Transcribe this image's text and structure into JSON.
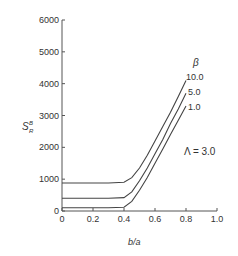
{
  "chart_data": {
    "type": "line",
    "title": "",
    "xlabel": "b/a",
    "ylabel": "S_R^B",
    "xlim": [
      0,
      1.0
    ],
    "ylim": [
      0,
      6000
    ],
    "xticks": [
      "0",
      "0.2",
      "0.4",
      "0.6",
      "0.8",
      "1.0"
    ],
    "yticks": [
      "0",
      "1000",
      "2000",
      "3000",
      "4000",
      "5000",
      "6000"
    ],
    "grid": false,
    "legend_title": "β",
    "annotation": "Λ = 3.0",
    "series": [
      {
        "name": "10.0",
        "x": [
          0,
          0.1,
          0.2,
          0.3,
          0.4,
          0.45,
          0.5,
          0.55,
          0.6,
          0.65,
          0.7,
          0.75,
          0.8
        ],
        "y": [
          880,
          880,
          880,
          880,
          900,
          1050,
          1350,
          1750,
          2200,
          2650,
          3100,
          3600,
          4100
        ]
      },
      {
        "name": "5.0",
        "x": [
          0,
          0.1,
          0.2,
          0.3,
          0.4,
          0.45,
          0.5,
          0.55,
          0.6,
          0.65,
          0.7,
          0.75,
          0.8
        ],
        "y": [
          400,
          400,
          400,
          400,
          420,
          600,
          950,
          1350,
          1800,
          2250,
          2750,
          3200,
          3700
        ]
      },
      {
        "name": "1.0",
        "x": [
          0,
          0.1,
          0.2,
          0.3,
          0.4,
          0.45,
          0.5,
          0.55,
          0.6,
          0.65,
          0.7,
          0.75,
          0.8
        ],
        "y": [
          100,
          100,
          100,
          100,
          120,
          300,
          650,
          1050,
          1500,
          1950,
          2400,
          2850,
          3300
        ]
      }
    ]
  }
}
